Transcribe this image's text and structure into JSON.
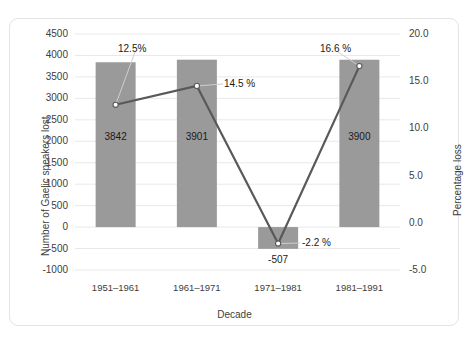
{
  "chart_data": {
    "type": "bar",
    "title": "",
    "subtitle": "",
    "xlabel": "Decade",
    "ylabel": "Number of Gaelic speakers lost",
    "y2label": "Percentage loss",
    "categories": [
      "1951–1961",
      "1961–1971",
      "1971–1981",
      "1981–1991"
    ],
    "series": [
      {
        "name": "Number of Gaelic speakers lost",
        "type": "bar",
        "axis": "left",
        "values": [
          3842,
          3901,
          -507,
          3900
        ],
        "data_labels": [
          "3842",
          "3901",
          "-507",
          "3900"
        ],
        "color": "#9a9a9a"
      },
      {
        "name": "Percentage loss",
        "type": "line",
        "axis": "right",
        "values": [
          12.5,
          14.5,
          -2.2,
          16.6
        ],
        "data_labels": [
          "12.5%",
          "14.5 %",
          "-2.2 %",
          "16.6 %"
        ],
        "color": "#595959",
        "marker": "circle-open"
      }
    ],
    "ylim": [
      -1000,
      4500
    ],
    "yticks": [
      4500,
      4000,
      3500,
      3000,
      2500,
      2000,
      1500,
      1000,
      500,
      0,
      -500,
      -1000
    ],
    "ytick_labels": [
      "4500",
      "4000",
      "3500",
      "3000",
      "2500",
      "2000",
      "1500",
      "1000",
      "500",
      "0",
      "-500",
      "-1000"
    ],
    "y2lim": [
      -5.0,
      20.0
    ],
    "y2ticks": [
      20.0,
      15.0,
      10.0,
      5.0,
      0.0,
      -5.0
    ],
    "y2tick_labels": [
      "20.0",
      "15.0",
      "10.0",
      "5.0",
      "0.0",
      "-5.0"
    ],
    "grid": "horizontal",
    "legend": "none",
    "background": "#ffffff",
    "gridline_color": "#e8e8e8"
  }
}
